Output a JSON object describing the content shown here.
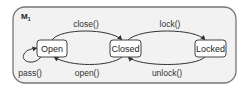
{
  "machine": {
    "name": "M",
    "subscript": "1"
  },
  "states": [
    {
      "id": "open",
      "label": "Open"
    },
    {
      "id": "closed",
      "label": "Closed"
    },
    {
      "id": "locked",
      "label": "Locked"
    }
  ],
  "transitions": [
    {
      "from": "open",
      "to": "closed",
      "label": "close()"
    },
    {
      "from": "closed",
      "to": "open",
      "label": "open()"
    },
    {
      "from": "closed",
      "to": "locked",
      "label": "lock()"
    },
    {
      "from": "locked",
      "to": "closed",
      "label": "unlock()"
    },
    {
      "from": "open",
      "to": "open",
      "label": "pass()"
    }
  ],
  "colors": {
    "frame_fill": "#f2f2f2",
    "frame_stroke": "#777777",
    "state_fill": "#ffffff",
    "state_stroke": "#444444",
    "arrow": "#333333"
  }
}
